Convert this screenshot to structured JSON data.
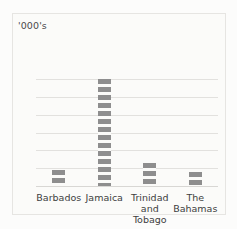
{
  "chart_data": {
    "type": "bar",
    "title": "",
    "subtitle": "",
    "xlabel": "",
    "ylabel": "'000's",
    "unit_label": "'000's",
    "categories": [
      "Barbados",
      "Jamaica",
      "Trinidad and Tobago",
      "The Bahamas"
    ],
    "values": [
      88,
      600,
      130,
      80
    ],
    "series": [
      {
        "name": "",
        "values": [
          88,
          600,
          130,
          80
        ]
      }
    ],
    "ylim": [
      0,
      600
    ],
    "yticks": [
      0,
      100,
      200,
      300,
      400,
      500,
      600
    ],
    "ytick_labels": [
      "0",
      "100",
      "200",
      "300",
      "400",
      "500",
      "600"
    ],
    "grid": true,
    "grid_axis": "y",
    "legend": false,
    "legend_position": "none",
    "bar_color": "#8e8e8e",
    "grid_color": "#e2e1de",
    "background_color": "#fbfbf9",
    "text_color": "#3e3e3e"
  },
  "axis": {
    "unit": "'000's",
    "ticks": [
      {
        "value": 600,
        "label": "600"
      },
      {
        "value": 500,
        "label": "500"
      },
      {
        "value": 400,
        "label": "400"
      },
      {
        "value": 300,
        "label": "300"
      },
      {
        "value": 200,
        "label": "200"
      },
      {
        "value": 100,
        "label": "100"
      },
      {
        "value": 0,
        "label": "0"
      }
    ]
  },
  "bars": [
    {
      "category": "Barbados",
      "label": "Barbados",
      "value": 88
    },
    {
      "category": "Jamaica",
      "label": "Jamaica",
      "value": 600
    },
    {
      "category": "Trinidad and Tobago",
      "label": "Trinidad\nand Tobago",
      "value": 130
    },
    {
      "category": "The Bahamas",
      "label": "The\nBahamas",
      "value": 80
    }
  ]
}
